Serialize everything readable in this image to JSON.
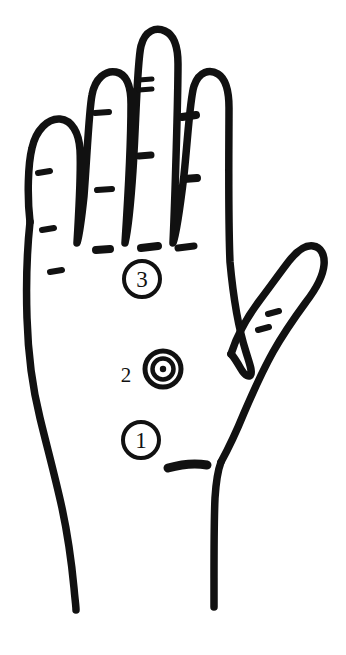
{
  "figure": {
    "background_color": "#ffffff",
    "ink_color": "#111111",
    "width": 346,
    "height": 655
  },
  "markers": [
    {
      "id": "marker-1",
      "label": "1",
      "style": "circle-outline",
      "label_position": "inside",
      "region": "lower palm",
      "cx": 141,
      "cy": 440,
      "r": 18
    },
    {
      "id": "marker-2",
      "label": "2",
      "style": "bullseye-concentric",
      "label_position": "outside-left",
      "region": "center palm",
      "cx": 163,
      "cy": 369,
      "r": 20,
      "label_x": 126,
      "label_y": 375
    },
    {
      "id": "marker-3",
      "label": "3",
      "style": "circle-outline",
      "label_position": "inside",
      "region": "upper palm",
      "cx": 142,
      "cy": 279,
      "r": 18
    }
  ],
  "anatomy": {
    "fingers": [
      {
        "name": "pinky-finger",
        "crease_marks": 3
      },
      {
        "name": "ring-finger",
        "crease_marks": 3
      },
      {
        "name": "middle-finger",
        "crease_marks": 3
      },
      {
        "name": "index-finger",
        "crease_marks": 3
      },
      {
        "name": "thumb",
        "crease_marks": 2
      }
    ],
    "palm_creases": 4,
    "wrist_lines": 2
  }
}
